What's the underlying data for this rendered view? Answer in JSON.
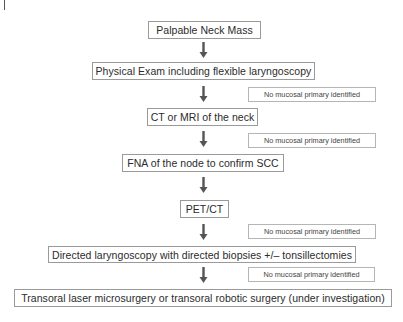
{
  "flowchart": {
    "steps": [
      {
        "label": "Palpable Neck Mass"
      },
      {
        "label": "Physical Exam including flexible laryngoscopy"
      },
      {
        "label": "CT or MRI of the neck"
      },
      {
        "label": "FNA of the node to confirm SCC"
      },
      {
        "label": "PET/CT"
      },
      {
        "label": "Directed laryngoscopy with directed biopsies +/– tonsillectomies"
      },
      {
        "label": "Transoral laser microsurgery or transoral robotic surgery (under investigation)"
      }
    ],
    "side_notes": [
      {
        "label": "No mucosal primary identified",
        "after_step": 2
      },
      {
        "label": "No mucosal primary identified",
        "after_step": 3
      },
      {
        "label": "No mucosal primary identified",
        "after_step": 5
      },
      {
        "label": "No mucosal primary identified",
        "after_step": 6
      }
    ],
    "arrow_icon": "down-arrow-icon",
    "colors": {
      "box_border": "#9a9a9a",
      "arrow": "#555555",
      "text": "#2b2b2b"
    }
  }
}
